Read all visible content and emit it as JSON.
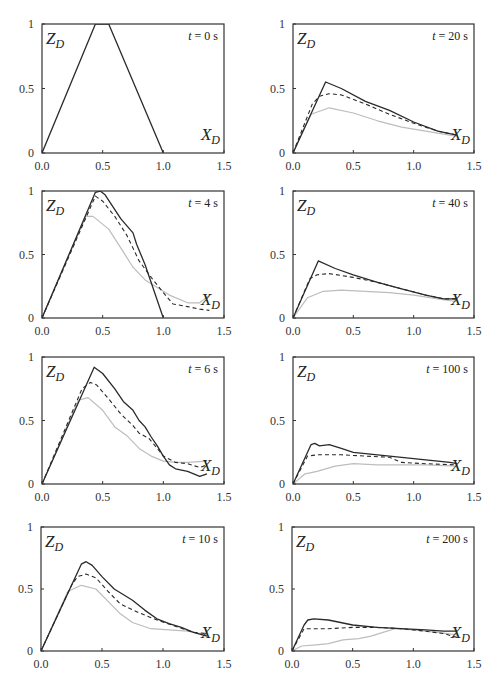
{
  "figure": {
    "x_ticks": [
      "0.0",
      "0.5",
      "1.0",
      "1.5"
    ],
    "y_ticks": [
      "0",
      "0.5",
      "1"
    ],
    "y_axis_symbol": "Z",
    "y_axis_subscript": "D",
    "x_axis_symbol": "X",
    "x_axis_subscript": "D",
    "colors": {
      "solid": "#2a2a2a",
      "dashed": "#2a2a2a",
      "dotted": "#bdbdbd",
      "frame": "#333333"
    }
  },
  "chart_data": [
    {
      "type": "line",
      "panel": 1,
      "title": "t = 0 s",
      "time_s": 0,
      "xlabel": "X_D",
      "ylabel": "Z_D",
      "xlim": [
        0,
        1.5
      ],
      "ylim": [
        0,
        1
      ],
      "grid": false,
      "series": [
        {
          "name": "solid",
          "points": [
            [
              0,
              0
            ],
            [
              0.44,
              1.0
            ],
            [
              0.55,
              1.0
            ],
            [
              1.0,
              0
            ]
          ]
        }
      ]
    },
    {
      "type": "line",
      "panel": 2,
      "title": "t = 20 s",
      "time_s": 20,
      "xlabel": "X_D",
      "ylabel": "Z_D",
      "xlim": [
        0,
        1.5
      ],
      "ylim": [
        0,
        1
      ],
      "grid": false,
      "series": [
        {
          "name": "solid",
          "points": [
            [
              0,
              0
            ],
            [
              0.27,
              0.55
            ],
            [
              0.4,
              0.5
            ],
            [
              0.6,
              0.4
            ],
            [
              0.8,
              0.33
            ],
            [
              1.0,
              0.24
            ],
            [
              1.2,
              0.17
            ],
            [
              1.35,
              0.14
            ]
          ]
        },
        {
          "name": "dashed",
          "points": [
            [
              0,
              0
            ],
            [
              0.16,
              0.38
            ],
            [
              0.22,
              0.44
            ],
            [
              0.3,
              0.46
            ],
            [
              0.4,
              0.45
            ],
            [
              0.6,
              0.38
            ],
            [
              0.8,
              0.3
            ],
            [
              1.0,
              0.23
            ],
            [
              1.2,
              0.17
            ],
            [
              1.35,
              0.14
            ]
          ]
        },
        {
          "name": "dotted",
          "points": [
            [
              0,
              0
            ],
            [
              0.15,
              0.3
            ],
            [
              0.3,
              0.35
            ],
            [
              0.5,
              0.31
            ],
            [
              0.7,
              0.25
            ],
            [
              0.9,
              0.2
            ],
            [
              1.1,
              0.17
            ],
            [
              1.35,
              0.13
            ]
          ]
        }
      ]
    },
    {
      "type": "line",
      "panel": 3,
      "title": "t = 4 s",
      "time_s": 4,
      "xlabel": "X_D",
      "ylabel": "Z_D",
      "xlim": [
        0,
        1.5
      ],
      "ylim": [
        0,
        1
      ],
      "grid": false,
      "series": [
        {
          "name": "solid",
          "points": [
            [
              0,
              0
            ],
            [
              0.44,
              0.99
            ],
            [
              0.48,
              1.0
            ],
            [
              0.52,
              0.97
            ],
            [
              0.65,
              0.78
            ],
            [
              0.75,
              0.67
            ],
            [
              0.78,
              0.58
            ],
            [
              0.85,
              0.42
            ],
            [
              1.0,
              0.0
            ]
          ]
        },
        {
          "name": "dashed",
          "points": [
            [
              0,
              0
            ],
            [
              0.44,
              0.96
            ],
            [
              0.5,
              0.92
            ],
            [
              0.6,
              0.8
            ],
            [
              0.7,
              0.65
            ],
            [
              0.8,
              0.45
            ],
            [
              0.9,
              0.32
            ],
            [
              1.0,
              0.2
            ],
            [
              1.08,
              0.11
            ],
            [
              1.2,
              0.09
            ],
            [
              1.3,
              0.07
            ],
            [
              1.38,
              0.06
            ]
          ]
        },
        {
          "name": "dotted",
          "points": [
            [
              0,
              0
            ],
            [
              0.36,
              0.8
            ],
            [
              0.42,
              0.8
            ],
            [
              0.55,
              0.7
            ],
            [
              0.65,
              0.55
            ],
            [
              0.75,
              0.4
            ],
            [
              0.85,
              0.3
            ],
            [
              0.95,
              0.24
            ],
            [
              1.05,
              0.18
            ],
            [
              1.2,
              0.12
            ],
            [
              1.3,
              0.12
            ],
            [
              1.38,
              0.18
            ]
          ]
        }
      ]
    },
    {
      "type": "line",
      "panel": 4,
      "title": "t = 40 s",
      "time_s": 40,
      "xlabel": "X_D",
      "ylabel": "Z_D",
      "xlim": [
        0,
        1.5
      ],
      "ylim": [
        0,
        1
      ],
      "grid": false,
      "series": [
        {
          "name": "solid",
          "points": [
            [
              0,
              0
            ],
            [
              0.21,
              0.45
            ],
            [
              0.35,
              0.39
            ],
            [
              0.5,
              0.34
            ],
            [
              0.7,
              0.28
            ],
            [
              0.9,
              0.23
            ],
            [
              1.1,
              0.18
            ],
            [
              1.25,
              0.15
            ],
            [
              1.35,
              0.15
            ]
          ]
        },
        {
          "name": "dashed",
          "points": [
            [
              0,
              0
            ],
            [
              0.14,
              0.31
            ],
            [
              0.2,
              0.34
            ],
            [
              0.3,
              0.35
            ],
            [
              0.5,
              0.32
            ],
            [
              0.7,
              0.28
            ],
            [
              0.9,
              0.23
            ],
            [
              1.1,
              0.18
            ],
            [
              1.25,
              0.15
            ],
            [
              1.35,
              0.15
            ]
          ]
        },
        {
          "name": "dotted",
          "points": [
            [
              0,
              0
            ],
            [
              0.12,
              0.16
            ],
            [
              0.25,
              0.21
            ],
            [
              0.4,
              0.22
            ],
            [
              0.6,
              0.21
            ],
            [
              0.8,
              0.2
            ],
            [
              1.0,
              0.18
            ],
            [
              1.2,
              0.15
            ],
            [
              1.35,
              0.13
            ]
          ]
        }
      ]
    },
    {
      "type": "line",
      "panel": 5,
      "title": "t = 6 s",
      "time_s": 6,
      "xlabel": "X_D",
      "ylabel": "Z_D",
      "xlim": [
        0,
        1.5
      ],
      "ylim": [
        0,
        1
      ],
      "grid": false,
      "series": [
        {
          "name": "solid",
          "points": [
            [
              0,
              0
            ],
            [
              0.43,
              0.92
            ],
            [
              0.5,
              0.87
            ],
            [
              0.6,
              0.75
            ],
            [
              0.67,
              0.65
            ],
            [
              0.75,
              0.58
            ],
            [
              0.8,
              0.5
            ],
            [
              0.85,
              0.45
            ],
            [
              0.9,
              0.37
            ],
            [
              0.95,
              0.3
            ],
            [
              1.0,
              0.22
            ],
            [
              1.05,
              0.15
            ],
            [
              1.1,
              0.12
            ],
            [
              1.2,
              0.1
            ],
            [
              1.3,
              0.06
            ],
            [
              1.36,
              0.08
            ]
          ]
        },
        {
          "name": "dashed",
          "points": [
            [
              0,
              0
            ],
            [
              0.33,
              0.75
            ],
            [
              0.4,
              0.8
            ],
            [
              0.45,
              0.78
            ],
            [
              0.55,
              0.67
            ],
            [
              0.65,
              0.55
            ],
            [
              0.75,
              0.46
            ],
            [
              0.8,
              0.4
            ],
            [
              0.88,
              0.36
            ],
            [
              0.95,
              0.28
            ],
            [
              1.0,
              0.22
            ],
            [
              1.1,
              0.17
            ],
            [
              1.2,
              0.16
            ],
            [
              1.3,
              0.13
            ],
            [
              1.36,
              0.15
            ]
          ]
        },
        {
          "name": "dotted",
          "points": [
            [
              0,
              0
            ],
            [
              0.3,
              0.66
            ],
            [
              0.38,
              0.68
            ],
            [
              0.5,
              0.58
            ],
            [
              0.6,
              0.45
            ],
            [
              0.7,
              0.38
            ],
            [
              0.8,
              0.28
            ],
            [
              0.9,
              0.22
            ],
            [
              1.0,
              0.18
            ],
            [
              1.1,
              0.17
            ],
            [
              1.2,
              0.17
            ],
            [
              1.36,
              0.18
            ]
          ]
        }
      ]
    },
    {
      "type": "line",
      "panel": 6,
      "title": "t = 100 s",
      "time_s": 100,
      "xlabel": "X_D",
      "ylabel": "Z_D",
      "xlim": [
        0,
        1.5
      ],
      "ylim": [
        0,
        1
      ],
      "grid": false,
      "series": [
        {
          "name": "solid",
          "points": [
            [
              0,
              0
            ],
            [
              0.15,
              0.31
            ],
            [
              0.18,
              0.32
            ],
            [
              0.22,
              0.3
            ],
            [
              0.3,
              0.31
            ],
            [
              0.4,
              0.28
            ],
            [
              0.5,
              0.25
            ],
            [
              0.7,
              0.23
            ],
            [
              0.9,
              0.21
            ],
            [
              1.1,
              0.19
            ],
            [
              1.3,
              0.17
            ],
            [
              1.36,
              0.16
            ]
          ]
        },
        {
          "name": "dashed",
          "points": [
            [
              0,
              0
            ],
            [
              0.12,
              0.22
            ],
            [
              0.2,
              0.23
            ],
            [
              0.4,
              0.23
            ],
            [
              0.6,
              0.22
            ],
            [
              0.8,
              0.21
            ],
            [
              0.9,
              0.17
            ],
            [
              1.1,
              0.16
            ],
            [
              1.36,
              0.15
            ]
          ]
        },
        {
          "name": "dotted",
          "points": [
            [
              0,
              0
            ],
            [
              0.1,
              0.08
            ],
            [
              0.2,
              0.1
            ],
            [
              0.35,
              0.14
            ],
            [
              0.5,
              0.16
            ],
            [
              0.7,
              0.15
            ],
            [
              0.9,
              0.15
            ],
            [
              1.1,
              0.15
            ],
            [
              1.36,
              0.14
            ]
          ]
        }
      ]
    },
    {
      "type": "line",
      "panel": 7,
      "title": "t = 10 s",
      "time_s": 10,
      "xlabel": "X_D",
      "ylabel": "Z_D",
      "xlim": [
        0,
        1.5
      ],
      "ylim": [
        0,
        1
      ],
      "grid": false,
      "series": [
        {
          "name": "solid",
          "points": [
            [
              0,
              0
            ],
            [
              0.33,
              0.7
            ],
            [
              0.37,
              0.72
            ],
            [
              0.42,
              0.69
            ],
            [
              0.5,
              0.6
            ],
            [
              0.6,
              0.5
            ],
            [
              0.75,
              0.41
            ],
            [
              0.85,
              0.33
            ],
            [
              0.95,
              0.26
            ],
            [
              1.05,
              0.22
            ],
            [
              1.15,
              0.19
            ],
            [
              1.25,
              0.15
            ],
            [
              1.36,
              0.12
            ]
          ]
        },
        {
          "name": "dashed",
          "points": [
            [
              0,
              0
            ],
            [
              0.25,
              0.53
            ],
            [
              0.3,
              0.6
            ],
            [
              0.37,
              0.62
            ],
            [
              0.45,
              0.59
            ],
            [
              0.55,
              0.48
            ],
            [
              0.65,
              0.38
            ],
            [
              0.8,
              0.31
            ],
            [
              0.95,
              0.25
            ],
            [
              1.1,
              0.2
            ],
            [
              1.25,
              0.15
            ],
            [
              1.36,
              0.14
            ]
          ]
        },
        {
          "name": "dotted",
          "points": [
            [
              0,
              0
            ],
            [
              0.22,
              0.48
            ],
            [
              0.33,
              0.53
            ],
            [
              0.45,
              0.5
            ],
            [
              0.55,
              0.4
            ],
            [
              0.65,
              0.3
            ],
            [
              0.75,
              0.23
            ],
            [
              0.9,
              0.18
            ],
            [
              1.05,
              0.17
            ],
            [
              1.2,
              0.16
            ],
            [
              1.36,
              0.13
            ]
          ]
        }
      ]
    },
    {
      "type": "line",
      "panel": 8,
      "title": "t = 200 s",
      "time_s": 200,
      "xlabel": "X_D",
      "ylabel": "Z_D",
      "xlim": [
        0,
        1.5
      ],
      "ylim": [
        0,
        1
      ],
      "grid": false,
      "series": [
        {
          "name": "solid",
          "points": [
            [
              0,
              0
            ],
            [
              0.1,
              0.21
            ],
            [
              0.13,
              0.25
            ],
            [
              0.18,
              0.26
            ],
            [
              0.3,
              0.25
            ],
            [
              0.5,
              0.21
            ],
            [
              0.7,
              0.19
            ],
            [
              0.9,
              0.18
            ],
            [
              1.1,
              0.17
            ],
            [
              1.25,
              0.16
            ],
            [
              1.36,
              0.16
            ]
          ]
        },
        {
          "name": "dashed",
          "points": [
            [
              0,
              0
            ],
            [
              0.1,
              0.18
            ],
            [
              0.3,
              0.18
            ],
            [
              0.5,
              0.19
            ],
            [
              0.7,
              0.19
            ],
            [
              0.9,
              0.18
            ],
            [
              1.1,
              0.16
            ],
            [
              1.25,
              0.14
            ],
            [
              1.36,
              0.11
            ]
          ]
        },
        {
          "name": "dotted",
          "points": [
            [
              0,
              0
            ],
            [
              0.08,
              0.04
            ],
            [
              0.2,
              0.05
            ],
            [
              0.3,
              0.06
            ],
            [
              0.42,
              0.09
            ],
            [
              0.55,
              0.1
            ],
            [
              0.65,
              0.12
            ],
            [
              0.75,
              0.15
            ],
            [
              0.85,
              0.18
            ],
            [
              1.0,
              0.17
            ],
            [
              1.2,
              0.15
            ],
            [
              1.36,
              0.13
            ]
          ]
        }
      ]
    }
  ]
}
